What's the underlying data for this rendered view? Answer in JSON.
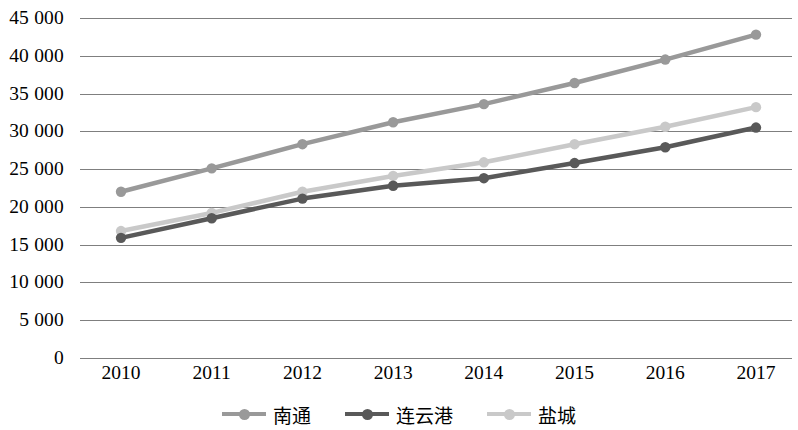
{
  "chart_data": {
    "type": "line",
    "title": "",
    "xlabel": "",
    "ylabel": "",
    "categories": [
      "2010",
      "2011",
      "2012",
      "2013",
      "2014",
      "2015",
      "2016",
      "2017"
    ],
    "ylim": [
      0,
      45000
    ],
    "ytick_step": 5000,
    "ytick_labels": [
      "45 000",
      "40 000",
      "35 000",
      "30 000",
      "25 000",
      "20 000",
      "15 000",
      "10 000",
      "5 000",
      "0"
    ],
    "ytick_values": [
      45000,
      40000,
      35000,
      30000,
      25000,
      20000,
      15000,
      10000,
      5000,
      0
    ],
    "grid": true,
    "legend_position": "bottom",
    "series": [
      {
        "name": "南通",
        "color": "#999999",
        "values": [
          22000,
          25100,
          28300,
          31200,
          33600,
          36400,
          39500,
          42800
        ]
      },
      {
        "name": "连云港",
        "color": "#595959",
        "values": [
          15900,
          18500,
          21100,
          22800,
          23800,
          25800,
          27900,
          30500
        ]
      },
      {
        "name": "盐城",
        "color": "#c9c9c9",
        "values": [
          16800,
          19200,
          22000,
          24100,
          25900,
          28300,
          30600,
          33200
        ]
      }
    ]
  },
  "legend": {
    "items": [
      {
        "label": "南通",
        "marker": "line-marker-icon"
      },
      {
        "label": "连云港",
        "marker": "line-marker-icon"
      },
      {
        "label": "盐城",
        "marker": "line-marker-icon"
      }
    ]
  },
  "axis": {
    "gridline_color": "#7f7f7f"
  }
}
